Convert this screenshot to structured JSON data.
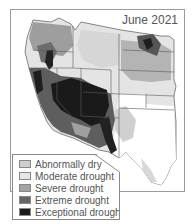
{
  "map": {
    "title": "June 2021",
    "region": "Western United States",
    "colors": {
      "none": "#ffffff",
      "abnormally_dry": "#d4d4d4",
      "moderate": "#e2e2e2",
      "severe": "#a9a9a9",
      "extreme": "#6f6f6f",
      "exceptional": "#1e1e1e",
      "border": "#5a5a5a"
    }
  },
  "legend": {
    "items": [
      {
        "label": "Abnormally dry",
        "color": "#cfcfcf"
      },
      {
        "label": "Moderate drought",
        "color": "#e6e6e6"
      },
      {
        "label": "Severe drought",
        "color": "#a3a3a3"
      },
      {
        "label": "Extreme drought",
        "color": "#666666"
      },
      {
        "label": "Exceptional drought",
        "color": "#1a1a1a"
      }
    ]
  }
}
